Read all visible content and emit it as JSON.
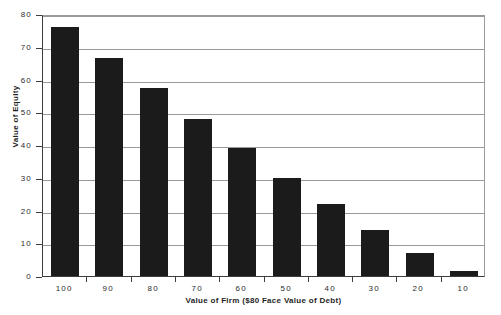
{
  "chart_data": {
    "type": "bar",
    "title": "",
    "xlabel": "Value of Firm ($80 Face Value of Debt)",
    "ylabel": "Value of Equity",
    "categories": [
      "100",
      "90",
      "80",
      "70",
      "60",
      "50",
      "40",
      "30",
      "20",
      "10"
    ],
    "values": [
      76,
      66.5,
      57.5,
      48,
      39,
      30,
      22,
      14,
      7,
      1.5
    ],
    "series": [
      {
        "name": "Value of Equity",
        "values": [
          76,
          66.5,
          57.5,
          48,
          39,
          30,
          22,
          14,
          7,
          1.5
        ]
      }
    ],
    "ylim": [
      0,
      80
    ],
    "ytick_values": [
      0,
      10,
      20,
      30,
      40,
      50,
      60,
      70,
      80
    ],
    "ytick_labels": [
      "0",
      "10",
      "20",
      "30",
      "40",
      "50",
      "60",
      "70",
      "80"
    ],
    "grid": "horizontal",
    "legend": "none",
    "bar_color": "#1b1b1b",
    "gridline_color": "#9a9a9a",
    "axis_color": "#3d3d3d",
    "background_color": "#ffffff"
  }
}
